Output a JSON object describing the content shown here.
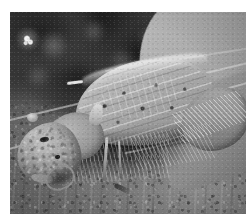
{
  "image": {
    "subject": "insect-macro-photograph",
    "description": "Close-up grayscale macro photograph of a cricket-like insect in left-facing profile resting on soil, with its forewing folded over the abdomen",
    "color_mode": "grayscale",
    "canvas": {
      "width": 252,
      "height": 221
    },
    "plate": {
      "left": 10,
      "top": 12,
      "width": 236,
      "height": 202
    },
    "margin_color": "#ffffff",
    "tones": {
      "highlight": "#f4f4f4",
      "light_gray": "#bdbdbd",
      "mid_gray": "#8d8d8d",
      "dark_gray": "#4a4a4a",
      "shadow": "#1a1a1a"
    },
    "regions": [
      {
        "name": "dark-vegetation-backdrop",
        "position": "upper-left and upper-center",
        "tone": "dark-gray"
      },
      {
        "name": "pale-leaf-blade",
        "position": "upper-right diagonal",
        "tone": "light-gray"
      },
      {
        "name": "soil-substrate",
        "position": "lower half",
        "tone": "mid-gray"
      },
      {
        "name": "deep-shadow-pocket",
        "position": "beneath insect body",
        "tone": "shadow"
      }
    ],
    "subject_parts": [
      {
        "name": "head",
        "position": "lower-left"
      },
      {
        "name": "compound-eye",
        "position": "on head, left of center"
      },
      {
        "name": "mouthpart-loop",
        "position": "front of head"
      },
      {
        "name": "pronotum",
        "position": "between head and wing"
      },
      {
        "name": "forewing-tegmen",
        "position": "center, dominating frame"
      },
      {
        "name": "wing-venation",
        "position": "longitudinal lines across forewing"
      },
      {
        "name": "wing-tip",
        "position": "right, curving downward"
      },
      {
        "name": "legs",
        "position": "center-bottom, in shadow"
      },
      {
        "name": "bristles",
        "position": "along lower body margin"
      }
    ],
    "features": [
      {
        "name": "specular-highlight",
        "position": "upper-left",
        "tone": "white"
      },
      {
        "name": "grass-blade-1",
        "orientation": "diagonal, upper-left to mid-right"
      },
      {
        "name": "grass-blade-2",
        "orientation": "diagonal, lower than blade-1"
      },
      {
        "name": "grass-blade-3",
        "orientation": "short diagonal, upper-right"
      }
    ]
  }
}
